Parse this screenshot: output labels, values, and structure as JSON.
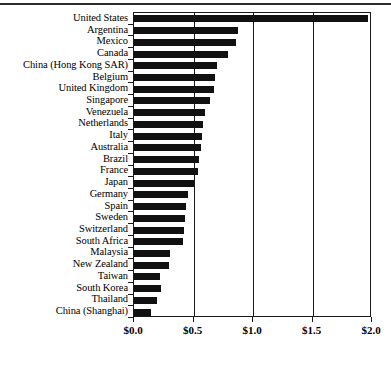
{
  "chart_data": {
    "type": "bar",
    "orientation": "horizontal",
    "title": "",
    "subtitle": "",
    "xlabel": "",
    "ylabel": "",
    "xlim": [
      0.0,
      2.0
    ],
    "xticks": [
      0.0,
      0.5,
      1.0,
      1.5,
      2.0
    ],
    "xtick_labels": [
      "$0.0",
      "$0.5",
      "$1.0",
      "$1.5",
      "$2.0"
    ],
    "grid": "vertical gridlines at x ticks",
    "legend": "none",
    "bar_color": "#111111",
    "categories": [
      "United States",
      "Argentina",
      "Mexico",
      "Canada",
      "China (Hong Kong SAR)",
      "Belgium",
      "United Kingdom",
      "Singapore",
      "Venezuela",
      "Netherlands",
      "Italy",
      "Australia",
      "Brazil",
      "France",
      "Japan",
      "Germany",
      "Spain",
      "Sweden",
      "Switzerland",
      "South Africa",
      "Malaysia",
      "New Zealand",
      "Taiwan",
      "South Korea",
      "Thailand",
      "China (Shanghai)"
    ],
    "values": [
      1.97,
      0.87,
      0.86,
      0.79,
      0.7,
      0.68,
      0.67,
      0.64,
      0.6,
      0.58,
      0.57,
      0.56,
      0.55,
      0.54,
      0.5,
      0.45,
      0.44,
      0.43,
      0.42,
      0.41,
      0.3,
      0.29,
      0.22,
      0.23,
      0.19,
      0.14
    ]
  },
  "axis": {
    "x_tick_labels": [
      "$0.0",
      "$0.5",
      "$1.0",
      "$1.5",
      "$2.0"
    ]
  }
}
